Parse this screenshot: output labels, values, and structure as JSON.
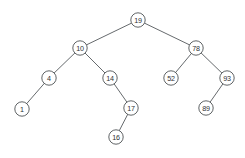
{
  "figure": {
    "background_color": "#ffffff",
    "node_fill": "#ffffff",
    "node_stroke": "#4e5255",
    "edge_stroke": "#55595c",
    "node_radius": 7.2,
    "width": 245,
    "height": 158
  },
  "chart_data": {
    "type": "diagram",
    "diagram_kind": "binary-search-tree",
    "title": "",
    "nodes": [
      {
        "id": "n19",
        "label": "19",
        "x": 138,
        "y": 20,
        "depth": 0
      },
      {
        "id": "n10",
        "label": "10",
        "x": 80,
        "y": 48,
        "depth": 1
      },
      {
        "id": "n78",
        "label": "78",
        "x": 196,
        "y": 48,
        "depth": 1
      },
      {
        "id": "n4",
        "label": "4",
        "x": 49,
        "y": 78,
        "depth": 2
      },
      {
        "id": "n14",
        "label": "14",
        "x": 110,
        "y": 78,
        "depth": 2
      },
      {
        "id": "n52",
        "label": "52",
        "x": 171,
        "y": 78,
        "depth": 2
      },
      {
        "id": "n93",
        "label": "93",
        "x": 227,
        "y": 78,
        "depth": 2
      },
      {
        "id": "n1",
        "label": "1",
        "x": 22,
        "y": 109,
        "depth": 3
      },
      {
        "id": "n17",
        "label": "17",
        "x": 131,
        "y": 108,
        "depth": 3
      },
      {
        "id": "n89",
        "label": "89",
        "x": 206,
        "y": 108,
        "depth": 3
      },
      {
        "id": "n16",
        "label": "16",
        "x": 116,
        "y": 137,
        "depth": 4
      }
    ],
    "edges": [
      {
        "from": "n19",
        "to": "n10",
        "side": "left"
      },
      {
        "from": "n19",
        "to": "n78",
        "side": "right"
      },
      {
        "from": "n10",
        "to": "n4",
        "side": "left"
      },
      {
        "from": "n10",
        "to": "n14",
        "side": "right"
      },
      {
        "from": "n4",
        "to": "n1",
        "side": "left"
      },
      {
        "from": "n14",
        "to": "n17",
        "side": "right"
      },
      {
        "from": "n17",
        "to": "n16",
        "side": "left"
      },
      {
        "from": "n78",
        "to": "n52",
        "side": "left"
      },
      {
        "from": "n78",
        "to": "n93",
        "side": "right"
      },
      {
        "from": "n93",
        "to": "n89",
        "side": "left"
      }
    ],
    "root": "n19",
    "values": [
      19,
      10,
      78,
      4,
      14,
      52,
      93,
      1,
      17,
      89,
      16
    ]
  }
}
